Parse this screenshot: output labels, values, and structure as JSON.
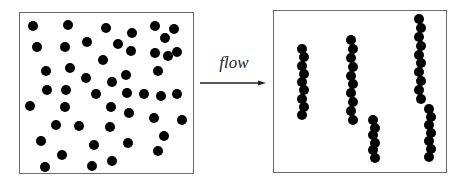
{
  "diagram": {
    "label": "flow",
    "left_panel": {
      "name": "scattered-particles",
      "dots": [
        [
          33,
          26
        ],
        [
          68,
          25
        ],
        [
          106,
          28
        ],
        [
          132,
          33
        ],
        [
          155,
          26
        ],
        [
          174,
          29
        ],
        [
          165,
          38
        ],
        [
          37,
          47
        ],
        [
          65,
          47
        ],
        [
          87,
          42
        ],
        [
          118,
          44
        ],
        [
          131,
          51
        ],
        [
          155,
          53
        ],
        [
          168,
          56
        ],
        [
          177,
          52
        ],
        [
          103,
          60
        ],
        [
          46,
          71
        ],
        [
          70,
          68
        ],
        [
          86,
          78
        ],
        [
          112,
          82
        ],
        [
          126,
          75
        ],
        [
          158,
          71
        ],
        [
          47,
          90
        ],
        [
          66,
          90
        ],
        [
          96,
          94
        ],
        [
          127,
          93
        ],
        [
          144,
          94
        ],
        [
          161,
          96
        ],
        [
          177,
          94
        ],
        [
          30,
          106
        ],
        [
          65,
          107
        ],
        [
          111,
          107
        ],
        [
          129,
          113
        ],
        [
          154,
          118
        ],
        [
          182,
          120
        ],
        [
          56,
          125
        ],
        [
          79,
          126
        ],
        [
          110,
          127
        ],
        [
          164,
          136
        ],
        [
          41,
          141
        ],
        [
          94,
          145
        ],
        [
          128,
          143
        ],
        [
          158,
          151
        ],
        [
          62,
          155
        ],
        [
          45,
          167
        ],
        [
          92,
          166
        ],
        [
          112,
          161
        ]
      ]
    },
    "right_panel": {
      "name": "aligned-chains",
      "chains": [
        {
          "x": 303,
          "y_start": 49,
          "y_end": 115,
          "count": 9
        },
        {
          "x": 352,
          "y_start": 40,
          "y_end": 120,
          "count": 10
        },
        {
          "x": 374,
          "y_start": 120,
          "y_end": 158,
          "count": 6
        },
        {
          "x": 420,
          "y_start": 19,
          "y_end": 99,
          "count": 10
        },
        {
          "x": 430,
          "y_start": 109,
          "y_end": 157,
          "count": 7
        }
      ]
    }
  }
}
